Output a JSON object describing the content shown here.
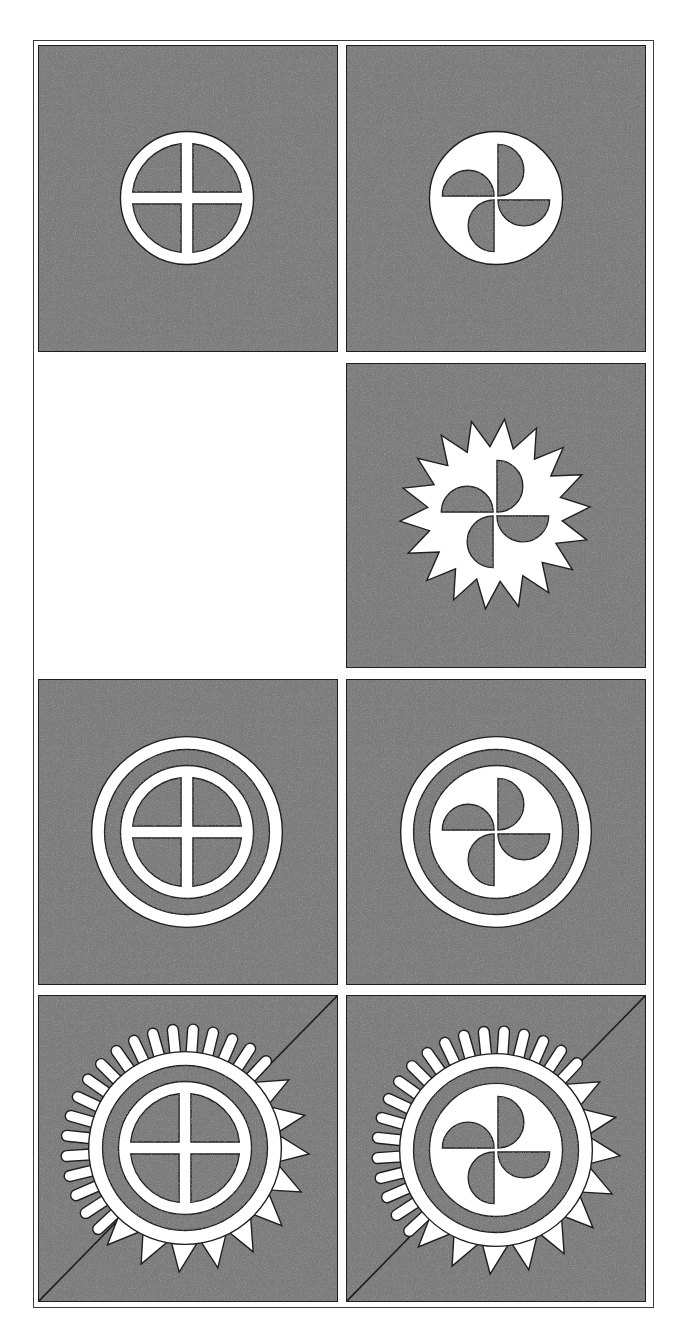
{
  "figure": {
    "colors": {
      "background": "#ffffff",
      "panel_fill": "#7a7a7a",
      "panel_grain_dark": "#3c3c3c",
      "panel_grain_light": "#b4b4b4",
      "symbol": "#ffffff",
      "outline": "#1e1e1e",
      "frame": "#3a3a3a"
    },
    "frame": {
      "x": 33,
      "y": 40,
      "w": 621,
      "h": 1268
    },
    "panels": [
      {
        "id": "p1",
        "row": 1,
        "col": 1,
        "x": 38,
        "y": 45,
        "w": 300,
        "h": 307,
        "symbol": "ring-cross",
        "cx": 187,
        "cy": 198,
        "diagonal": false
      },
      {
        "id": "p2",
        "row": 1,
        "col": 2,
        "x": 346,
        "y": 45,
        "w": 300,
        "h": 307,
        "symbol": "disc-pinwheel",
        "cx": 496,
        "cy": 198,
        "diagonal": false
      },
      {
        "id": "p3",
        "row": 2,
        "col": 1,
        "x": 38,
        "y": 363,
        "w": 300,
        "h": 305,
        "symbol": "empty",
        "diagonal": false
      },
      {
        "id": "p4",
        "row": 2,
        "col": 2,
        "x": 346,
        "y": 363,
        "w": 300,
        "h": 305,
        "symbol": "star-pinwheel",
        "cx": 495,
        "cy": 514,
        "diagonal": false
      },
      {
        "id": "p5",
        "row": 3,
        "col": 1,
        "x": 38,
        "y": 679,
        "w": 300,
        "h": 306,
        "symbol": "double-ring-cross",
        "cx": 187,
        "cy": 832,
        "diagonal": false
      },
      {
        "id": "p6",
        "row": 3,
        "col": 2,
        "x": 346,
        "y": 679,
        "w": 300,
        "h": 306,
        "symbol": "double-ring-pinwheel",
        "cx": 496,
        "cy": 832,
        "diagonal": false
      },
      {
        "id": "p7",
        "row": 4,
        "col": 1,
        "x": 38,
        "y": 995,
        "w": 300,
        "h": 307,
        "symbol": "sun-ring-cross",
        "cx": 185,
        "cy": 1148,
        "diagonal": true
      },
      {
        "id": "p8",
        "row": 4,
        "col": 2,
        "x": 346,
        "y": 995,
        "w": 300,
        "h": 307,
        "symbol": "sun-ring-pinwheel",
        "cx": 496,
        "cy": 1150,
        "diagonal": true
      }
    ],
    "geometry": {
      "ring_outer_r": 67,
      "ring_thickness": 12,
      "cross_bar_width": 12,
      "outer_ring_outer_r": 96,
      "outer_ring_thickness": 13,
      "pinwheel_blade_r": 26,
      "star_points": 18,
      "star_outer_r": 96,
      "star_inner_r": 68,
      "sun_disc_r": 97,
      "sun_dark_ring_outer_r": 83,
      "sun_inner_ring_outer_r": 67,
      "sun_inner_ring_thickness": 12,
      "sun_tongue_count": 19,
      "sun_tongue_outer_r": 125,
      "sun_spike_count": 10,
      "sun_spike_outer_r": 125
    }
  }
}
